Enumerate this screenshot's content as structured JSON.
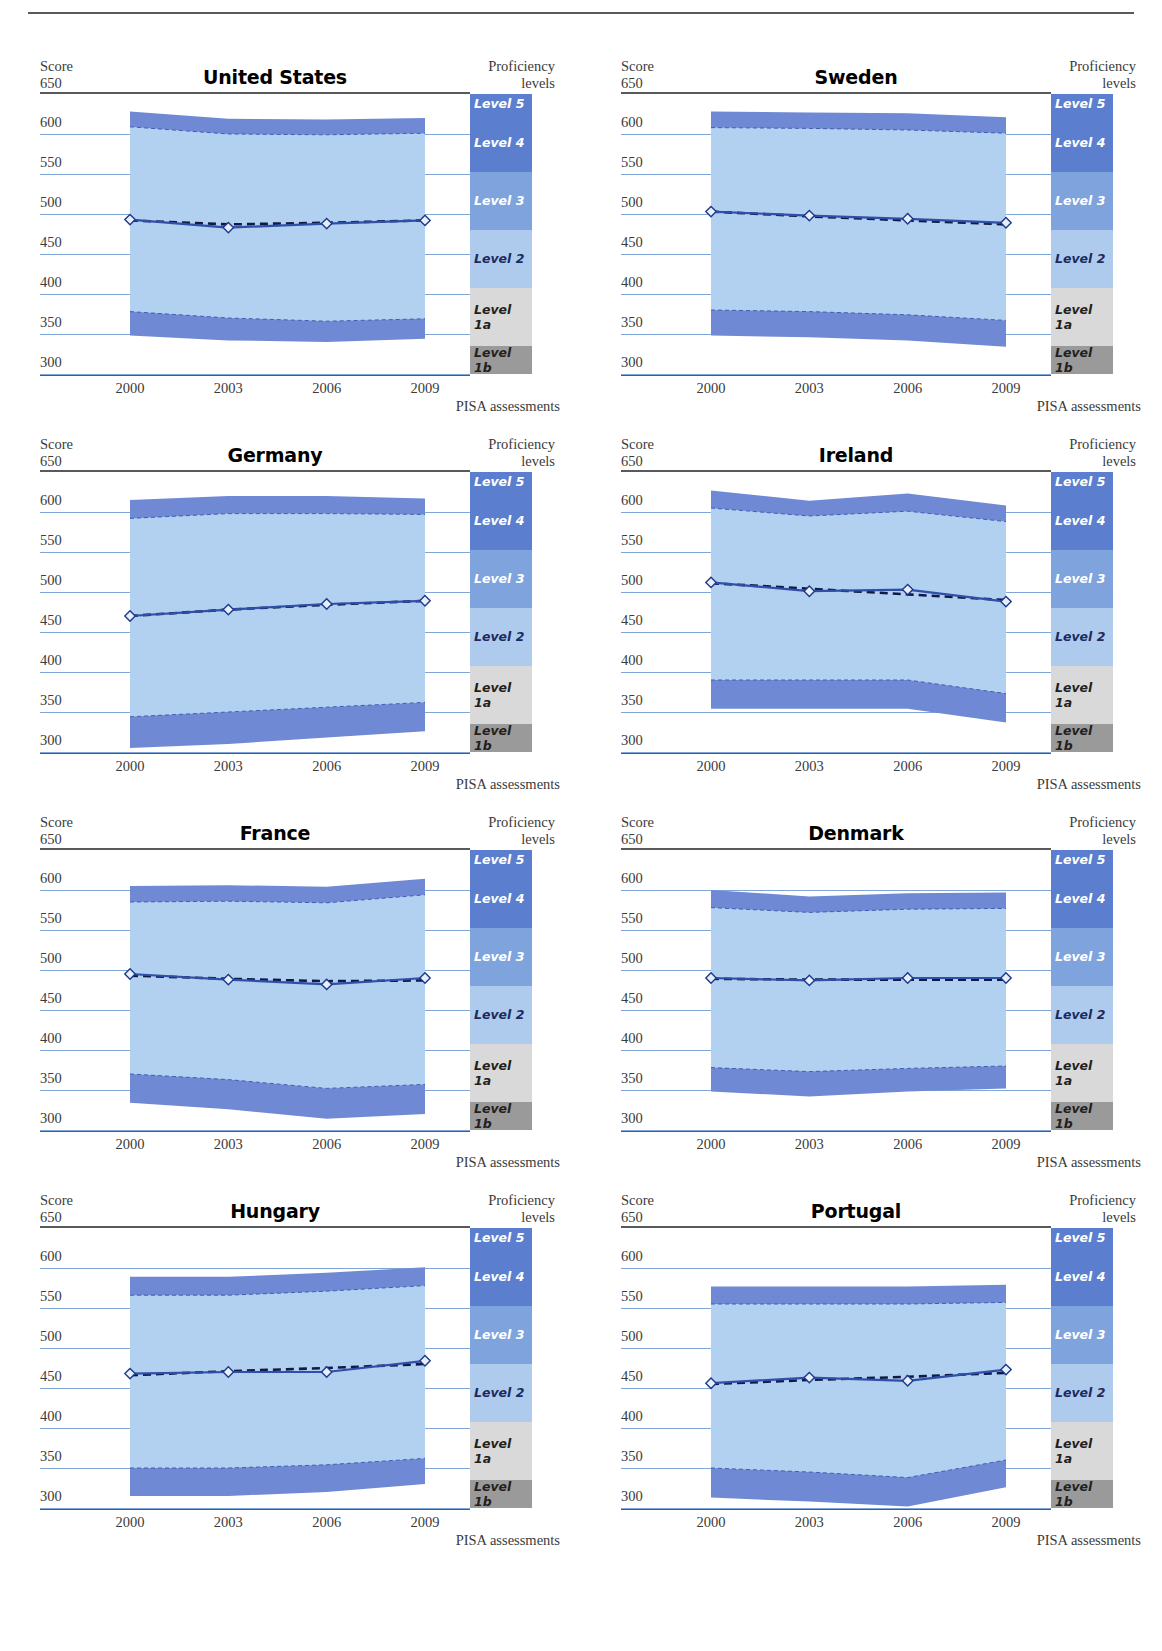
{
  "axes": {
    "y_title": "Score",
    "y_ticks": [
      650,
      600,
      550,
      500,
      450,
      400,
      350,
      300
    ],
    "x_title": "PISA assessments",
    "x_ticks": [
      "2000",
      "2003",
      "2006",
      "2009"
    ],
    "ylim": [
      300,
      650
    ]
  },
  "legend": {
    "title_line1": "Proficiency",
    "title_line2": "levels",
    "levels": [
      {
        "label": "Level 5",
        "from": 625.61,
        "to": 650,
        "color": "#5b7fce",
        "text": "#ffffff"
      },
      {
        "label": "Level 4",
        "from": 552.89,
        "to": 625.61,
        "color": "#5b7fce",
        "text": "#ffffff"
      },
      {
        "label": "Level 3",
        "from": 480.18,
        "to": 552.89,
        "color": "#7fa3dd",
        "text": "#ffffff"
      },
      {
        "label": "Level 2",
        "from": 407.47,
        "to": 480.18,
        "color": "#aecbee",
        "text": "#1c2a5e"
      },
      {
        "label": "Level 1a",
        "from": 334.75,
        "to": 407.47,
        "color": "#d9d9d9",
        "text": "#231f20"
      },
      {
        "label": "Level 1b",
        "from": 300,
        "to": 334.75,
        "color": "#9a9a9a",
        "text": "#231f20"
      }
    ]
  },
  "colors": {
    "band_outer": "#7089d4",
    "band_inner": "#b2d0ef",
    "mean_line": "#2f4fa8",
    "trend_line": "#10194a",
    "gridline": "#7fa6d9",
    "axis": "#58595b",
    "marker_fill": "#e8eefc",
    "marker_stroke": "#1b3a88"
  },
  "chart_data": {
    "type": "line",
    "title": "",
    "xlabel": "PISA assessments",
    "ylabel": "Score",
    "x": [
      2000,
      2003,
      2006,
      2009
    ],
    "ylim": [
      300,
      650
    ],
    "grid": true,
    "legend_position": "right",
    "panels": [
      {
        "title": "United States",
        "mean": [
          504,
          495,
          null,
          500
        ],
        "mean_plotted": [
          493,
          483,
          488,
          492
        ],
        "trend": [
          492,
          487,
          489,
          492
        ],
        "p95": [
          628,
          619,
          618,
          620
        ],
        "p90": [
          609,
          600,
          599,
          601
        ],
        "p10": [
          378,
          370,
          366,
          369
        ],
        "p5": [
          348,
          342,
          340,
          344
        ]
      },
      {
        "title": "Sweden",
        "mean_plotted": [
          503,
          498,
          494,
          489
        ],
        "trend": [
          503,
          497,
          492,
          487
        ],
        "p95": [
          628,
          627,
          626,
          621
        ],
        "p90": [
          608,
          607,
          605,
          601
        ],
        "p10": [
          380,
          378,
          374,
          367
        ],
        "p5": [
          348,
          346,
          342,
          334
        ]
      },
      {
        "title": "Germany",
        "mean_plotted": [
          470,
          478,
          485,
          489
        ],
        "trend": [
          470,
          478,
          484,
          489
        ],
        "p95": [
          615,
          620,
          620,
          617
        ],
        "p90": [
          592,
          598,
          598,
          597
        ],
        "p10": [
          344,
          350,
          356,
          362
        ],
        "p5": [
          305,
          310,
          318,
          326
        ]
      },
      {
        "title": "Ireland",
        "mean_plotted": [
          512,
          501,
          503,
          488
        ],
        "trend": [
          511,
          504,
          497,
          490
        ],
        "p95": [
          627,
          614,
          623,
          608
        ],
        "p90": [
          605,
          595,
          601,
          588
        ],
        "p10": [
          390,
          390,
          390,
          373
        ],
        "p5": [
          354,
          354,
          354,
          337
        ]
      },
      {
        "title": "France",
        "mean_plotted": [
          495,
          488,
          482,
          490
        ],
        "trend": [
          493,
          489,
          486,
          487
        ],
        "p95": [
          605,
          606,
          604,
          614
        ],
        "p90": [
          585,
          586,
          584,
          594
        ],
        "p10": [
          370,
          363,
          352,
          357
        ],
        "p5": [
          334,
          326,
          314,
          320
        ]
      },
      {
        "title": "Denmark",
        "mean_plotted": [
          490,
          487,
          490,
          490
        ],
        "trend": [
          489,
          488,
          488,
          488
        ],
        "p95": [
          600,
          592,
          596,
          597
        ],
        "p90": [
          578,
          572,
          576,
          577
        ],
        "p10": [
          378,
          373,
          377,
          380
        ],
        "p5": [
          348,
          342,
          348,
          352
        ]
      },
      {
        "title": "Hungary",
        "mean_plotted": [
          468,
          470,
          470,
          484
        ],
        "trend": [
          466,
          471,
          475,
          480
        ],
        "p95": [
          589,
          589,
          594,
          601
        ],
        "p90": [
          566,
          566,
          571,
          578
        ],
        "p10": [
          350,
          350,
          354,
          362
        ],
        "p5": [
          315,
          315,
          320,
          330
        ]
      },
      {
        "title": "Portugal",
        "mean_plotted": [
          456,
          463,
          459,
          473
        ],
        "trend": [
          455,
          460,
          464,
          469
        ],
        "p95": [
          577,
          577,
          577,
          579
        ],
        "p90": [
          555,
          555,
          555,
          557
        ],
        "p10": [
          350,
          345,
          338,
          360
        ],
        "p5": [
          313,
          308,
          302,
          326
        ]
      }
    ]
  }
}
